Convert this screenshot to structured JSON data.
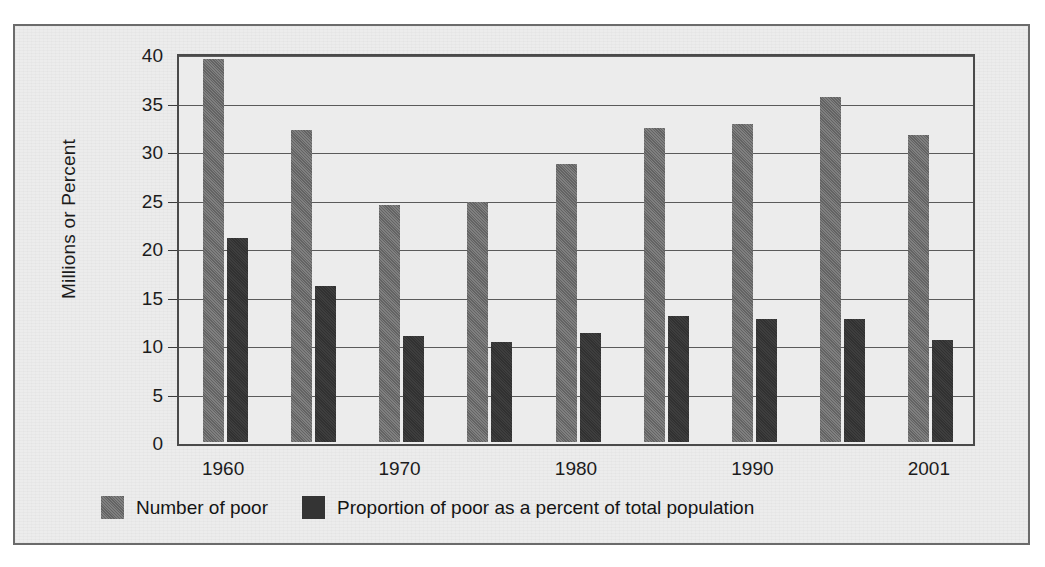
{
  "chart_data": {
    "type": "bar",
    "title": "",
    "subtitle": "",
    "xlabel": "",
    "ylabel": "Millions or Percent",
    "ylim": [
      0,
      40
    ],
    "yticks": [
      0,
      5,
      10,
      15,
      20,
      25,
      30,
      35,
      40
    ],
    "ytick_labels": [
      "0",
      "5",
      "10",
      "15",
      "20",
      "25",
      "30",
      "35",
      "40"
    ],
    "grid": true,
    "legend_position": "bottom-left",
    "categories": [
      "1960",
      "1965",
      "1970",
      "1975",
      "1980",
      "1985",
      "1990",
      "1995",
      "2001"
    ],
    "xtick_labels": [
      "1960",
      "1970",
      "1980",
      "1990",
      "2001"
    ],
    "xtick_categories": [
      "1960",
      "1970",
      "1980",
      "1990",
      "2001"
    ],
    "series": [
      {
        "name": "Number of poor",
        "color": "#6e6e6e",
        "values": [
          39.5,
          32.2,
          24.4,
          24.7,
          28.7,
          32.4,
          32.8,
          35.6,
          31.6
        ]
      },
      {
        "name": "Proportion of poor as a percent of total population",
        "color": "#343434",
        "values": [
          21.0,
          16.1,
          10.9,
          10.3,
          11.2,
          13.0,
          12.7,
          12.7,
          10.5
        ]
      }
    ]
  },
  "legend": {
    "items": [
      {
        "label": "Number of poor",
        "swatch": "legend-swatch-light"
      },
      {
        "label": "Proportion of poor as a percent of total population",
        "swatch": "legend-swatch-dark"
      }
    ]
  },
  "colors": {
    "series_light": "#6e6e6e",
    "series_dark": "#343434",
    "paper": "#ececec",
    "frame": "#6b6b6b",
    "axis": "#4a4a4a",
    "grid": "#5a5a5a",
    "text": "#1c1c1c"
  }
}
